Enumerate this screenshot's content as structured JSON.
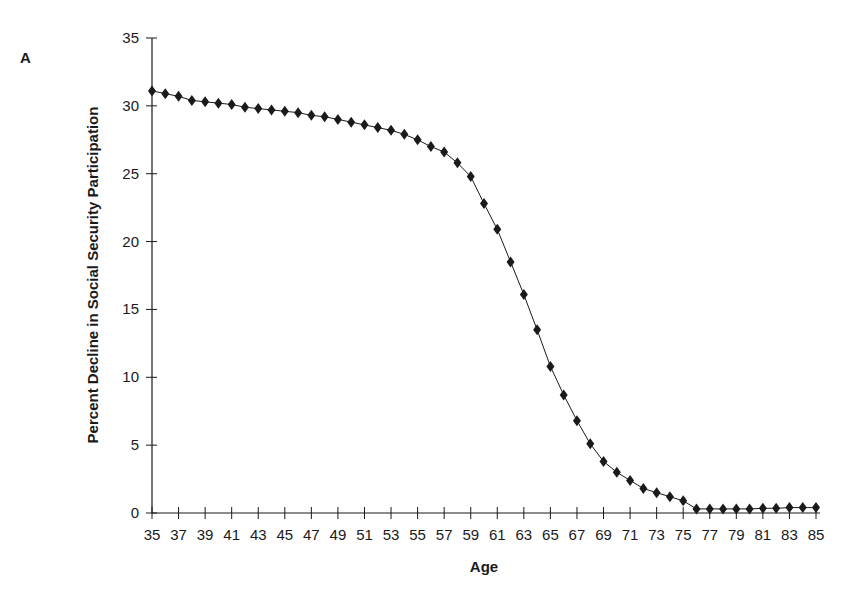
{
  "panel_label": "A",
  "chart_data": {
    "type": "line",
    "title": "",
    "xlabel": "Age",
    "ylabel": "Percent Decline in Social Security Participation",
    "x": [
      35,
      36,
      37,
      38,
      39,
      40,
      41,
      42,
      43,
      44,
      45,
      46,
      47,
      48,
      49,
      50,
      51,
      52,
      53,
      54,
      55,
      56,
      57,
      58,
      59,
      60,
      61,
      62,
      63,
      64,
      65,
      66,
      67,
      68,
      69,
      70,
      71,
      72,
      73,
      74,
      75,
      76,
      77,
      78,
      79,
      80,
      81,
      82,
      83,
      84,
      85
    ],
    "series": [
      {
        "name": "Percent Decline",
        "marker": "diamond",
        "values": [
          31.1,
          30.9,
          30.7,
          30.4,
          30.3,
          30.2,
          30.1,
          29.9,
          29.8,
          29.7,
          29.6,
          29.5,
          29.3,
          29.2,
          29.0,
          28.8,
          28.6,
          28.4,
          28.2,
          27.9,
          27.5,
          27.0,
          26.6,
          25.8,
          24.8,
          22.8,
          20.9,
          18.5,
          16.1,
          13.5,
          10.8,
          8.7,
          6.8,
          5.1,
          3.8,
          3.0,
          2.4,
          1.8,
          1.5,
          1.2,
          0.9,
          0.3,
          0.3,
          0.3,
          0.3,
          0.3,
          0.35,
          0.35,
          0.4,
          0.4,
          0.4
        ]
      }
    ],
    "xlim": [
      35,
      85
    ],
    "ylim": [
      0,
      35
    ],
    "xticks": [
      "35",
      "37",
      "39",
      "41",
      "43",
      "45",
      "47",
      "49",
      "51",
      "53",
      "55",
      "57",
      "59",
      "61",
      "63",
      "65",
      "67",
      "69",
      "71",
      "73",
      "75",
      "77",
      "79",
      "81",
      "83",
      "85"
    ],
    "yticks": [
      "0",
      "5",
      "10",
      "15",
      "20",
      "25",
      "30",
      "35"
    ],
    "grid": false,
    "legend": null,
    "colors": {
      "line": "#1a1a1a",
      "marker": "#1a1a1a",
      "axis": "#1a1a1a"
    }
  }
}
